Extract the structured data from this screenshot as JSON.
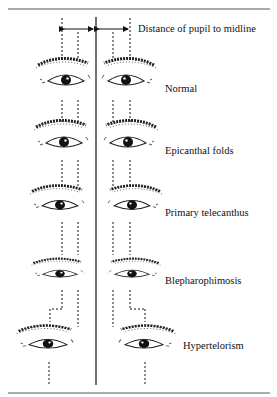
{
  "figure": {
    "header_label": "Distance of pupil to midline",
    "rows": [
      {
        "id": "normal",
        "label": "Normal"
      },
      {
        "id": "epicanthal",
        "label": "Epicanthal folds"
      },
      {
        "id": "telecanthus",
        "label": "Primary telecanthus"
      },
      {
        "id": "blepharophimosis",
        "label": "Blepharophimosis"
      },
      {
        "id": "hypertelorism",
        "label": "Hypertelorism"
      }
    ],
    "colors": {
      "ink": "#111111",
      "background": "#ffffff",
      "rule": "#555555"
    }
  }
}
